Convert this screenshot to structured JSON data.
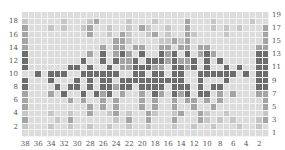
{
  "chart_data": {
    "type": "heatmap",
    "title": "",
    "subtitle": "Knitting colorwork chart",
    "columns": 38,
    "rows": 19,
    "x_ticks": [
      38,
      36,
      34,
      32,
      30,
      28,
      26,
      24,
      22,
      20,
      18,
      16,
      14,
      12,
      10,
      8,
      6,
      4,
      2
    ],
    "y_ticks_left": [
      18,
      16,
      14,
      12,
      10,
      8,
      6,
      4,
      2
    ],
    "y_ticks_right": [
      19,
      17,
      15,
      13,
      11,
      9,
      7,
      5,
      3,
      1
    ],
    "legend": {
      ".": {
        "name": "background",
        "color": "#dcdcdc"
      },
      "l": {
        "name": "light",
        "color": "#c6c6c6"
      },
      "m": {
        "name": "medium",
        "color": "#a4a4a4"
      },
      "d": {
        "name": "dark",
        "color": "#6c6c6c"
      }
    },
    "grid_rows_top_to_bottom": [
      "......................................",
      "l.....l...lm....l...l....m...l.....l..",
      "m...l.l..lm..l..l.ml..l..m...l.l.l...m",
      "m.........m..l.ml..lm.l..ml....l.....m",
      "m.............mml....llmlm...........m",
      "m...........m.mm.mm..mm.mm.mm.......mm",
      "d.........m.d.mdm.d..dmd.d.mdm......dd",
      "d........d..d.dmmd.dddmdmmd.d.d.....dd",
      "d......dd.d..d.mmdddmm.ddmd.d..d.d..dd",
      "..d.ddd..dddddd..dd.dd.dd..dddddd.d.dd",
      "d...d...d.d.dd.dddddddddd..d...d....dd",
      "d....d.dd.d.ddmdd.dddd.ddd.d.dd.....dd",
      "m...m.d..d.dmd.m..m.dm.dmd.dd.m.m...mm",
      "m......m.m..m.m...m.m..m.mm.m.m......m",
      "m.........m.m.m...m.m..m..m..m.......m",
      "l...l..l..m..lm.l..ml..lm..ml..l.....l",
      "m....l.m......l.m..m...m...ml.l.l...lm",
      "l...l..l..l..l..l..l...l..l..l...l..l.",
      "......................................"
    ]
  }
}
